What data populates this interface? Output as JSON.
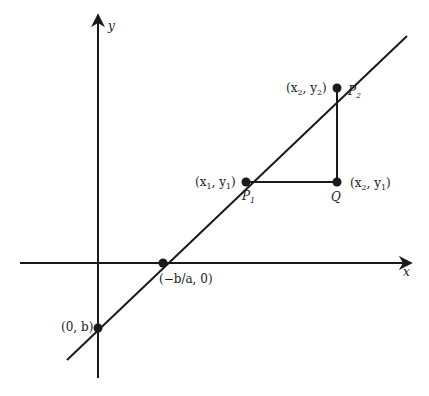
{
  "diagram": {
    "axes": {
      "x_label": "x",
      "y_label": "y"
    },
    "points": {
      "x_intercept": {
        "label": "(−b/a, 0)",
        "name": "x-intercept"
      },
      "y_intercept": {
        "label": "(0, b)",
        "name": "y-intercept"
      },
      "p1": {
        "name": "P",
        "sub": "1",
        "coord_label_parts": [
          "(x",
          "1",
          ", y",
          "1",
          ")"
        ]
      },
      "p2": {
        "name": "P",
        "sub": "2",
        "coord_label_parts": [
          "(x",
          "2",
          ", y",
          "2",
          ")"
        ]
      },
      "q": {
        "name": "Q",
        "coord_label_parts": [
          "(x",
          "2",
          ", y",
          "1",
          ")"
        ]
      }
    },
    "colors": {
      "stroke": "#1a1a1a",
      "background": "#ffffff"
    }
  }
}
